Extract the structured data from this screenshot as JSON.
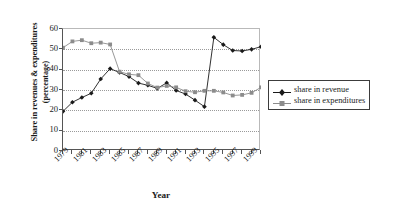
{
  "chart_data": {
    "type": "line",
    "title": "",
    "xlabel": "Year",
    "ylabel": "Share in revenues & expenditures (percentage)",
    "ylabel_line1": "Share in revenues & expenditures",
    "ylabel_line2": "(percentage)",
    "x": [
      1979,
      1980,
      1981,
      1982,
      1983,
      1984,
      1985,
      1986,
      1987,
      1988,
      1989,
      1990,
      1991,
      1992,
      1993,
      1994,
      1995,
      1996,
      1997,
      1998,
      1999,
      2000
    ],
    "xlim": [
      1979,
      2000
    ],
    "ylim": [
      0,
      60
    ],
    "yticks": [
      0,
      10,
      20,
      30,
      40,
      50,
      60
    ],
    "xtick_labels": [
      "1979",
      "1981",
      "1983",
      "1985",
      "1987",
      "1989",
      "1991",
      "1993",
      "1995",
      "1997",
      "1999"
    ],
    "xtick_values": [
      1979,
      1981,
      1983,
      1985,
      1987,
      1989,
      1991,
      1993,
      1995,
      1997,
      1999
    ],
    "grid": true,
    "grid_axis": "y",
    "legend_position": "right",
    "series": [
      {
        "name": "share in revenue",
        "color": "#1a1a1a",
        "marker": "diamond",
        "values": [
          19.5,
          24.0,
          26.3,
          28.4,
          35.4,
          40.5,
          38.6,
          36.6,
          33.4,
          32.3,
          30.8,
          33.5,
          29.8,
          28.0,
          25.0,
          21.8,
          55.9,
          52.3,
          49.4,
          49.2,
          50.0,
          51.3
        ]
      },
      {
        "name": "share in expenditures",
        "color": "#8c8c8c",
        "marker": "square",
        "values": [
          50.8,
          53.9,
          54.5,
          53.0,
          53.3,
          52.4,
          39.0,
          37.7,
          37.3,
          33.2,
          31.2,
          32.0,
          31.3,
          29.4,
          28.9,
          29.6,
          29.6,
          28.8,
          27.3,
          27.6,
          28.6,
          31.3
        ]
      }
    ]
  },
  "legend": {
    "items": [
      {
        "label": "share in revenue"
      },
      {
        "label": "share in expenditures"
      }
    ]
  }
}
